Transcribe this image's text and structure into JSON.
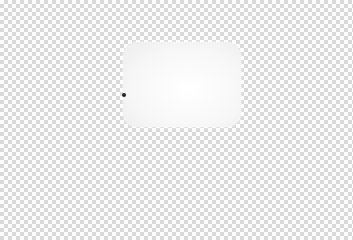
{
  "canvas": {
    "background": "transparent-checkerboard",
    "checker_colors": [
      "#ffffff",
      "#d9d9d9"
    ]
  },
  "shape": {
    "type": "rounded-rectangle",
    "fill": "#f7f7f7"
  },
  "marker": {
    "type": "dot",
    "color": "#222222"
  }
}
